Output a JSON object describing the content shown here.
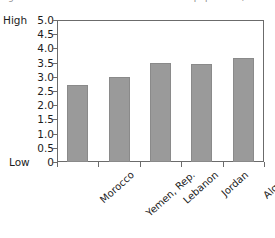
{
  "title_fragments": {
    "left": "g",
    "right": "f the population)"
  },
  "axis": {
    "high_label": "High",
    "low_label": "Low",
    "y_ticks": [
      "5.0",
      "4.5",
      "4.0",
      "3.5",
      "3.0",
      "2.5",
      "2.0",
      "1.5",
      "1.0",
      "0.5",
      "0"
    ],
    "clipped_next_label": "Sa"
  },
  "colors": {
    "bar_fill": "#9a9a9a",
    "bar_stroke": "#8a8a8a",
    "axis_line": "#6b6b6b",
    "text": "#1c1c1c",
    "background": "#ffffff"
  },
  "chart_data": {
    "type": "bar",
    "title": "",
    "xlabel": "",
    "ylabel": "",
    "ylim": [
      0,
      5.0
    ],
    "ytick_values": [
      5.0,
      4.5,
      4.0,
      3.5,
      3.0,
      2.5,
      2.0,
      1.5,
      1.0,
      0.5,
      0
    ],
    "grid": false,
    "legend": "none",
    "categories": [
      "Morocco",
      "Yemen, Rep.",
      "Lebanon",
      "Jordan",
      "Algeria"
    ],
    "values": [
      2.7,
      3.0,
      3.47,
      3.46,
      3.65
    ],
    "annotations": [
      "High at 5.0",
      "Low at 0"
    ]
  }
}
